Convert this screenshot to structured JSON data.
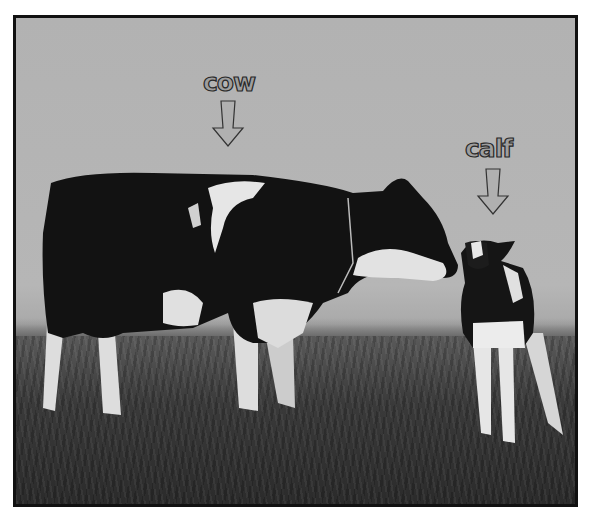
{
  "image": {
    "description": "Black-and-white photo of a Holstein cow and her calf standing on a grassy field, with labels and arrows",
    "colors": {
      "sky": "#b4b4b4",
      "border": "#111111",
      "grass": "#3a3a3a",
      "label_fill": "#9e9e9e",
      "label_outline": "#2a2a2a"
    }
  },
  "annotations": [
    {
      "label": "cow",
      "arrow": "down-arrow-icon"
    },
    {
      "label": "calf",
      "arrow": "down-arrow-icon"
    }
  ]
}
